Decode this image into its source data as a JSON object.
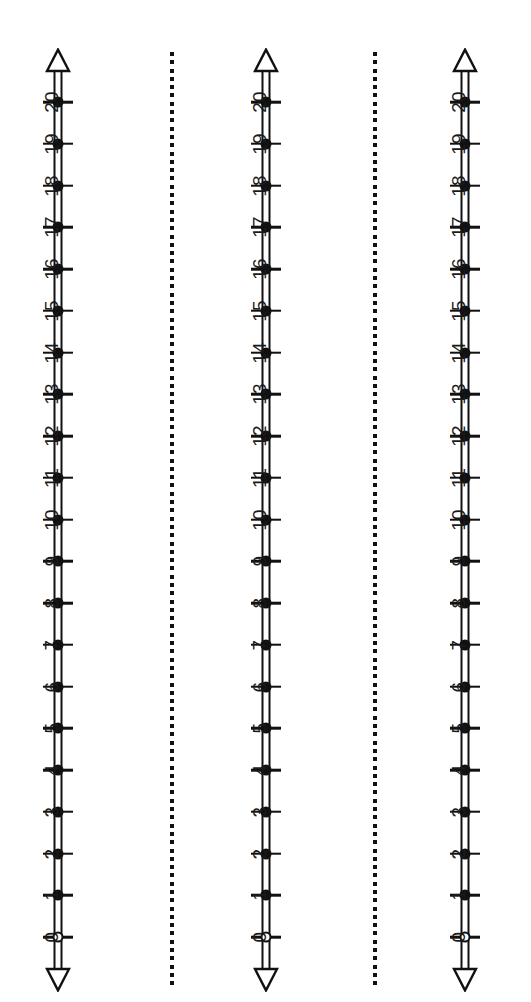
{
  "page": {
    "background_color": "#ffffff",
    "ink_color": "#111111",
    "width": 531,
    "height": 1002
  },
  "chart_data": {
    "type": "line",
    "xlabel": "",
    "ylabel": "",
    "orientation": "vertical",
    "grid": false,
    "legend_position": "none",
    "axis_range": [
      0,
      20
    ],
    "tick_step": 1,
    "tick_labels": [
      "0",
      "1",
      "2",
      "3",
      "4",
      "5",
      "6",
      "7",
      "8",
      "9",
      "10",
      "11",
      "12",
      "13",
      "14",
      "15",
      "16",
      "17",
      "18",
      "19",
      "20"
    ],
    "tick_values": [
      0,
      1,
      2,
      3,
      4,
      5,
      6,
      7,
      8,
      9,
      10,
      11,
      12,
      13,
      14,
      15,
      16,
      17,
      18,
      19,
      20
    ],
    "marker_styles": [
      "open",
      "filled",
      "filled",
      "filled",
      "filled",
      "filled",
      "filled",
      "filled",
      "filled",
      "filled",
      "filled",
      "filled",
      "filled",
      "filled",
      "filled",
      "filled",
      "filled",
      "filled",
      "filled",
      "filled",
      "filled"
    ],
    "series": [
      {
        "name": "Number line 1",
        "values": [
          0,
          1,
          2,
          3,
          4,
          5,
          6,
          7,
          8,
          9,
          10,
          11,
          12,
          13,
          14,
          15,
          16,
          17,
          18,
          19,
          20
        ]
      },
      {
        "name": "Number line 2",
        "values": [
          0,
          1,
          2,
          3,
          4,
          5,
          6,
          7,
          8,
          9,
          10,
          11,
          12,
          13,
          14,
          15,
          16,
          17,
          18,
          19,
          20
        ]
      },
      {
        "name": "Number line 3",
        "values": [
          0,
          1,
          2,
          3,
          4,
          5,
          6,
          7,
          8,
          9,
          10,
          11,
          12,
          13,
          14,
          15,
          16,
          17,
          18,
          19,
          20
        ]
      }
    ]
  },
  "numberlines": [
    {
      "id": "numberline-1",
      "name": "Number line 1",
      "center_x": 58,
      "ticks": [
        {
          "label": "0",
          "marker": "open"
        },
        {
          "label": "1",
          "marker": "filled"
        },
        {
          "label": "2",
          "marker": "filled"
        },
        {
          "label": "3",
          "marker": "filled"
        },
        {
          "label": "4",
          "marker": "filled"
        },
        {
          "label": "5",
          "marker": "filled"
        },
        {
          "label": "6",
          "marker": "filled"
        },
        {
          "label": "7",
          "marker": "filled"
        },
        {
          "label": "8",
          "marker": "filled"
        },
        {
          "label": "9",
          "marker": "filled"
        },
        {
          "label": "10",
          "marker": "filled"
        },
        {
          "label": "11",
          "marker": "filled"
        },
        {
          "label": "12",
          "marker": "filled"
        },
        {
          "label": "13",
          "marker": "filled"
        },
        {
          "label": "14",
          "marker": "filled"
        },
        {
          "label": "15",
          "marker": "filled"
        },
        {
          "label": "16",
          "marker": "filled"
        },
        {
          "label": "17",
          "marker": "filled"
        },
        {
          "label": "18",
          "marker": "filled"
        },
        {
          "label": "19",
          "marker": "filled"
        },
        {
          "label": "20",
          "marker": "filled"
        }
      ]
    },
    {
      "id": "numberline-2",
      "name": "Number line 2",
      "center_x": 266,
      "ticks": [
        {
          "label": "0",
          "marker": "open"
        },
        {
          "label": "1",
          "marker": "filled"
        },
        {
          "label": "2",
          "marker": "filled"
        },
        {
          "label": "3",
          "marker": "filled"
        },
        {
          "label": "4",
          "marker": "filled"
        },
        {
          "label": "5",
          "marker": "filled"
        },
        {
          "label": "6",
          "marker": "filled"
        },
        {
          "label": "7",
          "marker": "filled"
        },
        {
          "label": "8",
          "marker": "filled"
        },
        {
          "label": "9",
          "marker": "filled"
        },
        {
          "label": "10",
          "marker": "filled"
        },
        {
          "label": "11",
          "marker": "filled"
        },
        {
          "label": "12",
          "marker": "filled"
        },
        {
          "label": "13",
          "marker": "filled"
        },
        {
          "label": "14",
          "marker": "filled"
        },
        {
          "label": "15",
          "marker": "filled"
        },
        {
          "label": "16",
          "marker": "filled"
        },
        {
          "label": "17",
          "marker": "filled"
        },
        {
          "label": "18",
          "marker": "filled"
        },
        {
          "label": "19",
          "marker": "filled"
        },
        {
          "label": "20",
          "marker": "filled"
        }
      ]
    },
    {
      "id": "numberline-3",
      "name": "Number line 3",
      "center_x": 465,
      "ticks": [
        {
          "label": "0",
          "marker": "open"
        },
        {
          "label": "1",
          "marker": "filled"
        },
        {
          "label": "2",
          "marker": "filled"
        },
        {
          "label": "3",
          "marker": "filled"
        },
        {
          "label": "4",
          "marker": "filled"
        },
        {
          "label": "5",
          "marker": "filled"
        },
        {
          "label": "6",
          "marker": "filled"
        },
        {
          "label": "7",
          "marker": "filled"
        },
        {
          "label": "8",
          "marker": "filled"
        },
        {
          "label": "9",
          "marker": "filled"
        },
        {
          "label": "10",
          "marker": "filled"
        },
        {
          "label": "11",
          "marker": "filled"
        },
        {
          "label": "12",
          "marker": "filled"
        },
        {
          "label": "13",
          "marker": "filled"
        },
        {
          "label": "14",
          "marker": "filled"
        },
        {
          "label": "15",
          "marker": "filled"
        },
        {
          "label": "16",
          "marker": "filled"
        },
        {
          "label": "17",
          "marker": "filled"
        },
        {
          "label": "18",
          "marker": "filled"
        },
        {
          "label": "19",
          "marker": "filled"
        },
        {
          "label": "20",
          "marker": "filled"
        }
      ]
    }
  ],
  "separators": [
    {
      "id": "separator-1",
      "x": 170,
      "top": 52,
      "bottom": 988,
      "dot_size": 4,
      "gap": 4.3
    },
    {
      "id": "separator-2",
      "x": 373,
      "top": 52,
      "bottom": 988,
      "dot_size": 4,
      "gap": 4.3
    }
  ],
  "geometry": {
    "tick_top_y": 102,
    "tick_spacing": 41.75,
    "arrow_top_tip_y": 49,
    "arrow_bottom_tip_y": 991
  }
}
